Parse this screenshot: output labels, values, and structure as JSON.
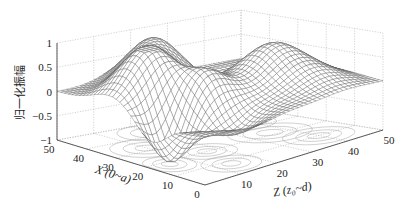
{
  "chart_data": {
    "type": "surface3d",
    "title": "",
    "xlabel": "X (0~a)",
    "zlabel": "Z (z₀~d)",
    "ylabel": "归一化振幅",
    "x_ticks": [
      "0",
      "10",
      "20",
      "30",
      "40",
      "50"
    ],
    "z_ticks": [
      "10",
      "20",
      "30",
      "40",
      "50"
    ],
    "amp_ticks": [
      "1",
      "0.5",
      "0",
      "−0.5",
      "−1"
    ],
    "x_range": [
      0,
      50
    ],
    "z_range": [
      0,
      50
    ],
    "amp_range": [
      -1,
      1
    ],
    "grid": true,
    "contour_projection": true,
    "mesh_resolution": 40,
    "surface_bumps": [
      {
        "x": 32,
        "z": 10,
        "amp": 1.0,
        "sx": 6,
        "sz": 6
      },
      {
        "x": 42,
        "z": 20,
        "amp": 0.9,
        "sx": 6,
        "sz": 6
      },
      {
        "x": 20,
        "z": 17,
        "amp": 0.6,
        "sx": 5,
        "sz": 5
      },
      {
        "x": 22,
        "z": 36,
        "amp": 0.85,
        "sx": 7,
        "sz": 7
      },
      {
        "x": 18,
        "z": 5,
        "amp": -1.0,
        "sx": 5,
        "sz": 4
      },
      {
        "x": 8,
        "z": 14,
        "amp": -0.4,
        "sx": 5,
        "sz": 5
      },
      {
        "x": 35,
        "z": 38,
        "amp": -0.3,
        "sx": 6,
        "sz": 6
      },
      {
        "x": 10,
        "z": 40,
        "amp": 0.25,
        "sx": 6,
        "sz": 6
      }
    ]
  },
  "projection": {
    "floor_origin": [
      205,
      185
    ],
    "floor_x50": [
      57,
      140
    ],
    "floor_z50": [
      383,
      130
    ],
    "floor_back": [
      241,
      107
    ],
    "vertical_px_per_unit": 48.5
  }
}
